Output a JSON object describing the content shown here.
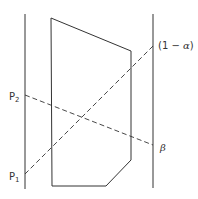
{
  "diagram": {
    "colors": {
      "stroke": "#333333",
      "background": "#ffffff"
    },
    "axes": {
      "left": {
        "x": 25,
        "y1": 14,
        "y2": 189
      },
      "right": {
        "x": 153,
        "y1": 14,
        "y2": 188
      }
    },
    "polygon": {
      "points": "51,18 131,51 131,160 106,186 52,186"
    },
    "dashed_lines": [
      {
        "name": "p2-to-beta",
        "x1": 25,
        "y1": 95,
        "x2": 153,
        "y2": 145
      },
      {
        "name": "p1-to-one-minus-alpha",
        "x1": 25,
        "y1": 174,
        "x2": 153,
        "y2": 46
      }
    ],
    "labels": {
      "p2": {
        "main": "P",
        "sub": "2"
      },
      "p1": {
        "main": "P",
        "sub": "1"
      },
      "one_minus_alpha": {
        "prefix": "(1 − ",
        "symbol": "α",
        "suffix": ")"
      },
      "beta": "β"
    }
  }
}
